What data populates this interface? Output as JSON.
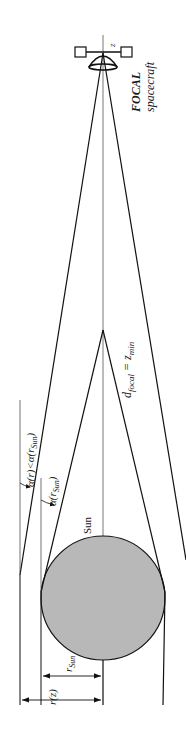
{
  "diagram": {
    "colors": {
      "line": "#111111",
      "axis": "#555555",
      "sun_fill": "#b8b8b8",
      "background": "#ffffff"
    },
    "spacecraft": {
      "name_bold": "FOCAL",
      "name_rest": "spacecraft",
      "axis_label": "z"
    },
    "sun": {
      "label": "Sun"
    },
    "focal": {
      "label_d": "d",
      "label_sub": "focal",
      "label_eq": " = z",
      "label_eq_sub": "min"
    },
    "angles": {
      "outer": {
        "alpha": "α(",
        "r": "r",
        "mid": ")<α(",
        "r2": "r",
        "sub": "Sun",
        "end": ")"
      },
      "inner": {
        "alpha": "α(",
        "r": "r",
        "sub": "Sun",
        "end": ")"
      }
    },
    "dimensions": {
      "r_sun": {
        "r": "r",
        "sub": "Sun"
      },
      "r_z": {
        "text": "r(z)"
      }
    }
  }
}
